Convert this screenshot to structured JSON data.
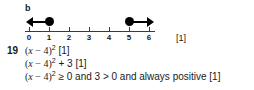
{
  "part": {
    "label": "b"
  },
  "number_line": {
    "tick_labels": [
      "0",
      "1",
      "2",
      "3",
      "4",
      "5",
      "6"
    ],
    "axis_min": 0,
    "axis_max": 6,
    "rays": [
      {
        "name": "left-ray",
        "endpoint": 1,
        "endpoint_style": "closed-circle",
        "direction": "left",
        "meaning": "x less than or equal to 1"
      },
      {
        "name": "right-ray",
        "endpoint": 5,
        "endpoint_style": "closed-circle",
        "direction": "right",
        "meaning": "x greater than or equal to 5"
      }
    ],
    "mark": "[1]"
  },
  "answer": {
    "question_number": "19",
    "lines": [
      {
        "expr_open": "(",
        "var": "x",
        "op": " − 4",
        "expr_close": ")",
        "exponent": "2",
        "tail": "",
        "mark": "[1]",
        "plain": "(x − 4)2 [1]"
      },
      {
        "expr_open": "(",
        "var": "x",
        "op": " − 4",
        "expr_close": ")",
        "exponent": "2",
        "tail": " + 3",
        "mark": "[1]",
        "plain": "(x − 4)2 + 3 [1]"
      },
      {
        "expr_open": "(",
        "var": "x",
        "op": " − 4",
        "expr_close": ")",
        "exponent": "2",
        "tail": " ≥ 0 and 3 > 0 and always positive",
        "mark": "[1]",
        "plain": "(x − 4)2 ≥ 0 and 3 > 0 and always positive [1]"
      }
    ]
  }
}
